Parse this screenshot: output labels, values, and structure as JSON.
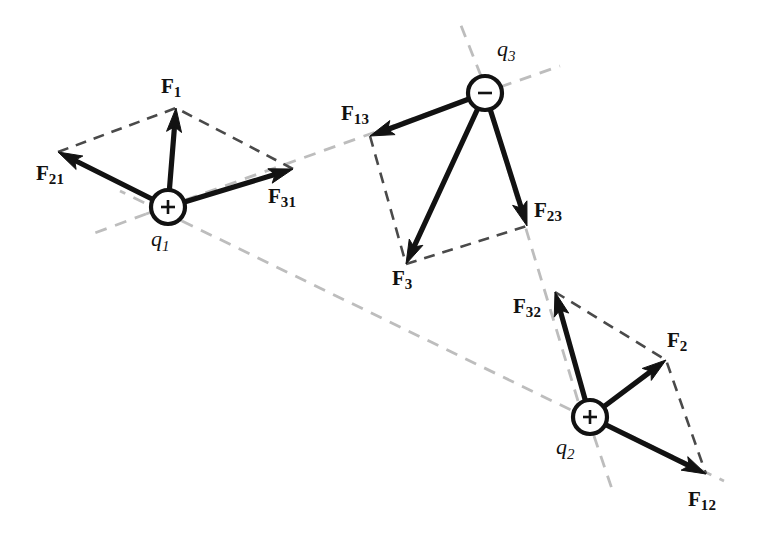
{
  "figure": {
    "background_color": "#ffffff",
    "vector_color": "#121212",
    "parallelogram_dash_color": "#4a4a4a",
    "axis_dash_color": "#bdbdbd",
    "width": 768,
    "height": 544
  },
  "charges": [
    {
      "id": "q1",
      "label": "q",
      "subscript": "1",
      "sign": "+",
      "sign_glyph": "+",
      "center": {
        "x": 168,
        "y": 207
      },
      "radius": 17,
      "label_position": {
        "x": 151,
        "y": 228
      }
    },
    {
      "id": "q2",
      "label": "q",
      "subscript": "2",
      "sign": "+",
      "sign_glyph": "+",
      "center": {
        "x": 590,
        "y": 417
      },
      "radius": 17,
      "label_position": {
        "x": 556,
        "y": 436
      }
    },
    {
      "id": "q3",
      "label": "q",
      "subscript": "3",
      "sign": "−",
      "sign_glyph": "−",
      "center": {
        "x": 485,
        "y": 93
      },
      "radius": 17,
      "label_position": {
        "x": 497,
        "y": 38
      }
    }
  ],
  "vectors": [
    {
      "id": "F21",
      "label": "F",
      "subscript": "21",
      "from": {
        "x": 168,
        "y": 207
      },
      "to": {
        "x": 58,
        "y": 152
      },
      "label_position": {
        "x": 36,
        "y": 163
      },
      "description": "force on charge 1 due to charge 2"
    },
    {
      "id": "F31",
      "label": "F",
      "subscript": "31",
      "from": {
        "x": 168,
        "y": 207
      },
      "to": {
        "x": 293,
        "y": 169
      },
      "label_position": {
        "x": 268,
        "y": 186
      },
      "description": "force on charge 1 due to charge 3"
    },
    {
      "id": "F1",
      "label": "F",
      "subscript": "1",
      "from": {
        "x": 168,
        "y": 207
      },
      "to": {
        "x": 176,
        "y": 108
      },
      "label_position": {
        "x": 161,
        "y": 76
      },
      "description": "net force on charge 1"
    },
    {
      "id": "F13",
      "label": "F",
      "subscript": "13",
      "from": {
        "x": 485,
        "y": 93
      },
      "to": {
        "x": 370,
        "y": 136
      },
      "label_position": {
        "x": 341,
        "y": 103
      },
      "description": "force on charge 3 due to charge 1"
    },
    {
      "id": "F23",
      "label": "F",
      "subscript": "23",
      "from": {
        "x": 485,
        "y": 93
      },
      "to": {
        "x": 527,
        "y": 226
      },
      "label_position": {
        "x": 534,
        "y": 200
      },
      "description": "force on charge 3 due to charge 2"
    },
    {
      "id": "F3",
      "label": "F",
      "subscript": "3",
      "from": {
        "x": 485,
        "y": 93
      },
      "to": {
        "x": 406,
        "y": 264
      },
      "label_position": {
        "x": 392,
        "y": 268
      },
      "description": "net force on charge 3"
    },
    {
      "id": "F32",
      "label": "F",
      "subscript": "32",
      "from": {
        "x": 590,
        "y": 417
      },
      "to": {
        "x": 555,
        "y": 292
      },
      "label_position": {
        "x": 513,
        "y": 296
      },
      "description": "force on charge 2 due to charge 3"
    },
    {
      "id": "F12",
      "label": "F",
      "subscript": "12",
      "from": {
        "x": 590,
        "y": 417
      },
      "to": {
        "x": 706,
        "y": 474
      },
      "label_position": {
        "x": 688,
        "y": 489
      },
      "description": "force on charge 2 due to charge 1"
    },
    {
      "id": "F2",
      "label": "F",
      "subscript": "2",
      "from": {
        "x": 590,
        "y": 417
      },
      "to": {
        "x": 666,
        "y": 360
      },
      "label_position": {
        "x": 667,
        "y": 330
      },
      "description": "net force on charge 2"
    }
  ],
  "parallelograms": [
    {
      "id": "parallelogram-q1",
      "points": "58,152 176,108 293,169",
      "description": "parallelogram construction for net force on q1"
    },
    {
      "id": "parallelogram-q3",
      "points": "370,136 406,264 527,226",
      "description": "parallelogram construction for net force on q3"
    },
    {
      "id": "parallelogram-q2",
      "points": "555,292 666,360 706,474",
      "description": "parallelogram construction for net force on q2"
    }
  ],
  "axis_lines": [
    {
      "id": "axis-q1-q3",
      "from": {
        "x": 146,
        "y": 214
      },
      "to": {
        "x": 468,
        "y": 99
      },
      "description": "line of action between q1 and q3"
    },
    {
      "id": "axis-q1-q3-extension-left",
      "from": {
        "x": 146,
        "y": 214
      },
      "to": {
        "x": 92,
        "y": 234
      },
      "description": "dashed extension left of q1 along q1-q3 axis"
    },
    {
      "id": "axis-q1-q3-extension-right",
      "from": {
        "x": 500,
        "y": 87
      },
      "to": {
        "x": 560,
        "y": 66
      },
      "description": "dashed extension beyond q3 along q1-q3 axis"
    },
    {
      "id": "axis-q1-q2",
      "from": {
        "x": 182,
        "y": 221
      },
      "to": {
        "x": 575,
        "y": 412
      },
      "description": "line of action between q1 and q2"
    },
    {
      "id": "axis-q1-q2-extension-left",
      "from": {
        "x": 182,
        "y": 221
      },
      "to": {
        "x": 120,
        "y": 191
      },
      "description": "dashed extension up-left of q1 along q1-q2 axis"
    },
    {
      "id": "axis-q1-q2-extension-right",
      "from": {
        "x": 606,
        "y": 424
      },
      "to": {
        "x": 724,
        "y": 481
      },
      "description": "dashed extension beyond q2 along q1-q2 axis"
    },
    {
      "id": "axis-q2-q3",
      "from": {
        "x": 578,
        "y": 401
      },
      "to": {
        "x": 490,
        "y": 110
      },
      "description": "line of action between q2 and q3"
    },
    {
      "id": "axis-q2-q3-extension-top",
      "from": {
        "x": 481,
        "y": 76
      },
      "to": {
        "x": 458,
        "y": 18
      },
      "description": "dashed extension above q3 along q2-q3 axis"
    },
    {
      "id": "axis-q2-q3-extension-bottom",
      "from": {
        "x": 594,
        "y": 436
      },
      "to": {
        "x": 614,
        "y": 495
      },
      "description": "dashed extension below q2 along q2-q3 axis"
    }
  ]
}
